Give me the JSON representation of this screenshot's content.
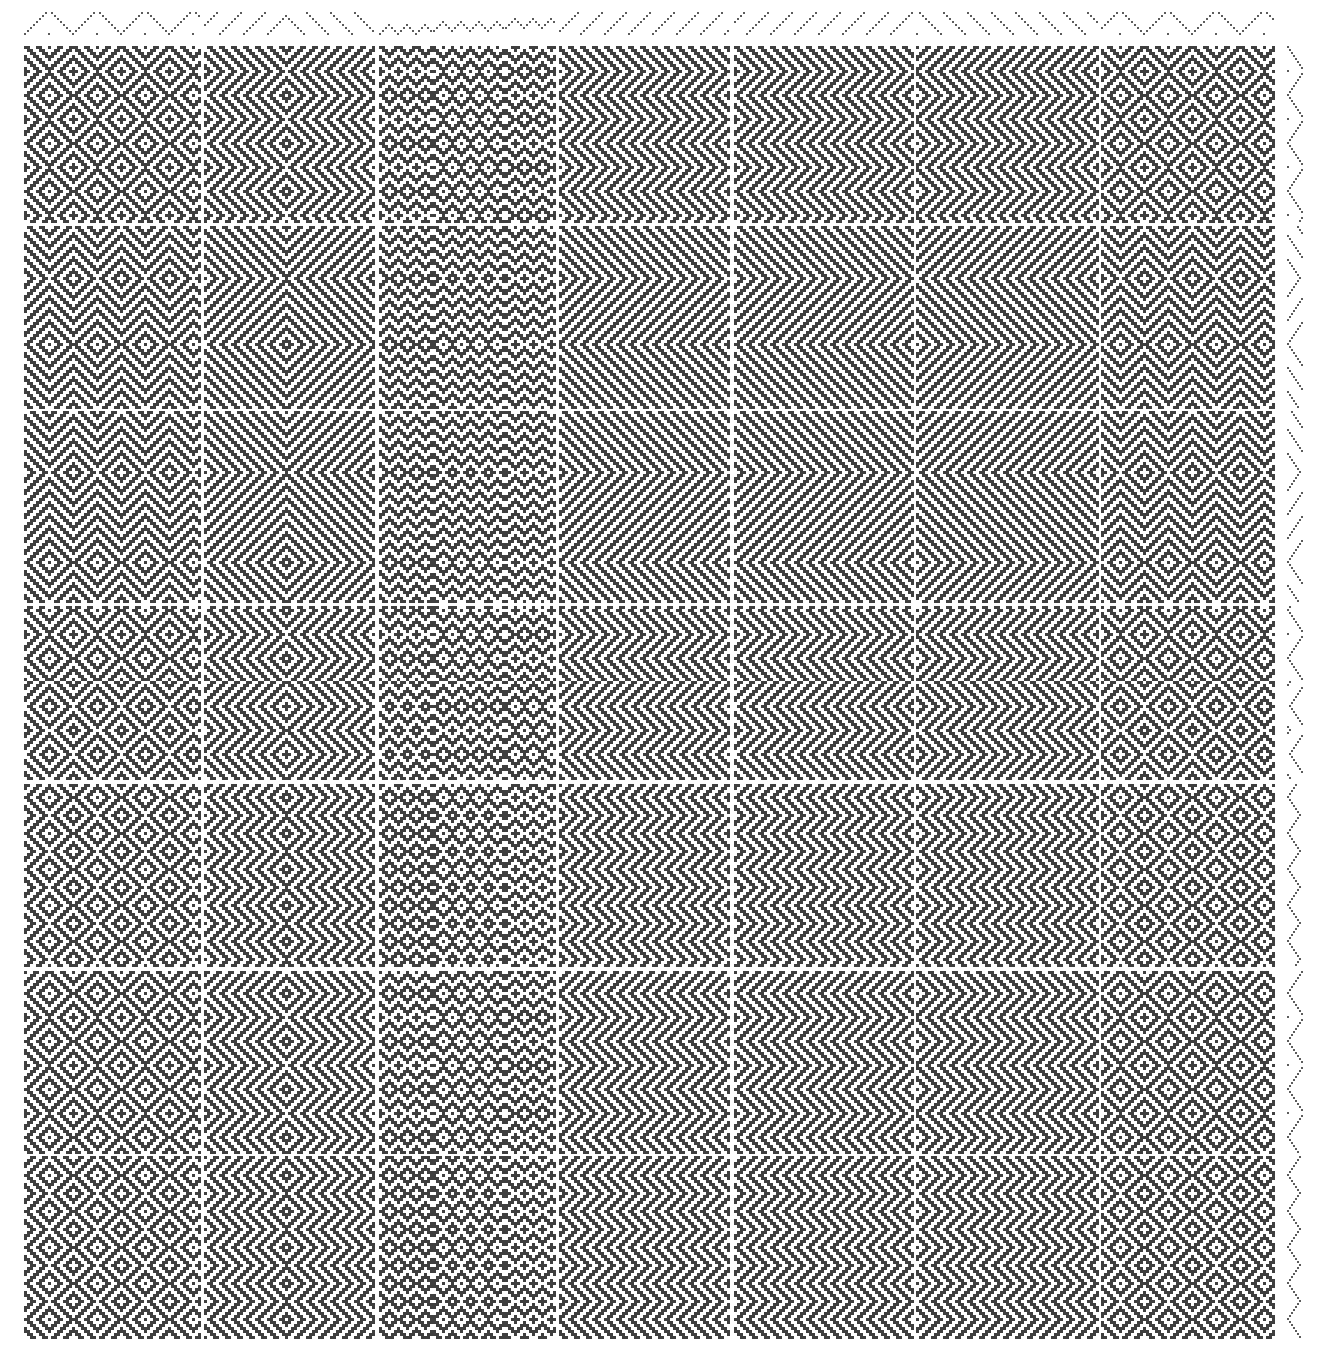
{
  "colors": {
    "ink": "#3f3f3f",
    "background": "#ffffff",
    "grid": "#ffffff"
  },
  "cell_px": 3,
  "drawdown": {
    "x": 23,
    "y": 45,
    "width": 1255,
    "height": 1295
  },
  "threading_strip": {
    "y": 12,
    "height": 22
  },
  "treadling_strip": {
    "x": 1287,
    "width": 20
  },
  "column_bounds": [
    23,
    203,
    378,
    558,
    733,
    915,
    1100,
    1278
  ],
  "row_bounds": [
    45,
    225,
    410,
    605,
    783,
    970,
    1155,
    1340
  ],
  "column_threadings": [
    "point",
    "point-wide",
    "zigzag-fine",
    "twill-s",
    "twill-s",
    "twill-z",
    "point"
  ],
  "row_treadlings": [
    "point",
    "point-skew",
    "point-wide",
    "mixed",
    "diamond",
    "point",
    "diamond"
  ]
}
